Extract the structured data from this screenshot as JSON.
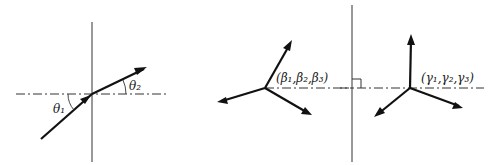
{
  "figure": {
    "panels": [
      {
        "name": "refraction-panel",
        "labels": {
          "theta1": "θ₁",
          "theta2": "θ₂"
        }
      },
      {
        "name": "beta-tripod-panel",
        "labels": {
          "direction_cosines": "(β₁,β₂,β₃)"
        }
      },
      {
        "name": "gamma-tripod-panel",
        "labels": {
          "direction_cosines": "(γ₁,γ₂,γ₃)"
        }
      }
    ],
    "colors": {
      "line": "#111111",
      "background": "#ffffff"
    }
  }
}
